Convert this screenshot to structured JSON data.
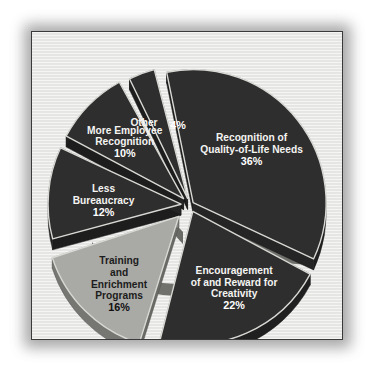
{
  "chart_data": {
    "type": "pie",
    "title": "",
    "subtitle": "",
    "xlabel": "",
    "ylabel": "",
    "legend_position": "none",
    "grid": false,
    "labels_inside_slices": true,
    "exploded": true,
    "three_d": true,
    "total_percent": "100%",
    "categories": [
      "Recognition of Quality-of-Life Needs",
      "Encouragement of and Reward for Creativity",
      "Training and Enrichment Programs",
      "Less Bureaucracy",
      "More Employee Recognition",
      "Other"
    ],
    "values": [
      36,
      22,
      16,
      12,
      10,
      4
    ],
    "slices": [
      {
        "key": "recognition-quality-of-life",
        "label_lines": [
          "Recognition of",
          "Quality-of-Life Needs"
        ],
        "value": 36,
        "value_label": "36%",
        "fill": "#2e2e2e",
        "text_color": "light"
      },
      {
        "key": "encouragement-reward-creativity",
        "label_lines": [
          "Encouragement",
          "of and Reward for",
          "Creativity"
        ],
        "value": 22,
        "value_label": "22%",
        "fill": "#2e2e2e",
        "text_color": "light"
      },
      {
        "key": "training-enrichment-programs",
        "label_lines": [
          "Training",
          "and",
          "Enrichment",
          "Programs"
        ],
        "value": 16,
        "value_label": "16%",
        "fill": "#a9a9a5",
        "text_color": "dark"
      },
      {
        "key": "less-bureaucracy",
        "label_lines": [
          "Less",
          "Bureaucracy"
        ],
        "value": 12,
        "value_label": "12%",
        "fill": "#2e2e2e",
        "text_color": "light"
      },
      {
        "key": "more-employee-recognition",
        "label_lines": [
          "More Employee",
          "Recognition"
        ],
        "value": 10,
        "value_label": "10%",
        "fill": "#2e2e2e",
        "text_color": "light"
      },
      {
        "key": "other",
        "label_lines": [
          "Other"
        ],
        "value": 4,
        "value_label": "4%",
        "fill": "#2e2e2e",
        "text_color": "light"
      }
    ],
    "colors": {
      "dark_slice": "#2e2e2e",
      "light_slice": "#a9a9a5",
      "slice_highlight_edge": "#d8d8d4",
      "slice_depth_shadow": "#6e6e6a",
      "panel_background": "#e9e9e7",
      "panel_border": "#3a3a3a",
      "page_background": "#ffffff"
    }
  }
}
